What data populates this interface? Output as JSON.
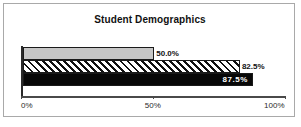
{
  "chart_data": {
    "type": "bar",
    "orientation": "horizontal",
    "title": "Student Demographics",
    "xlabel": "",
    "ylabel": "",
    "xlim": [
      0,
      100
    ],
    "grid": false,
    "legend": "none",
    "tick_labels": [
      "0%",
      "50%",
      "100%"
    ],
    "tick_values": [
      0,
      50,
      100
    ],
    "categories": [
      "",
      "",
      ""
    ],
    "values": [
      50.0,
      82.5,
      87.5
    ],
    "data_labels": [
      "50.0%",
      "82.5%",
      "87.5%"
    ],
    "series": [
      {
        "name": "bar-1",
        "value": 50.0,
        "label": "50.0%",
        "fill": "light-gray",
        "color": "#c6c6c6",
        "label_position": "outside"
      },
      {
        "name": "bar-2",
        "value": 82.5,
        "label": "82.5%",
        "fill": "diagonal-hatch",
        "color": "#111111",
        "label_position": "outside"
      },
      {
        "name": "bar-3",
        "value": 87.5,
        "label": "87.5%",
        "fill": "solid-black",
        "color": "#080808",
        "label_position": "inside"
      }
    ]
  }
}
